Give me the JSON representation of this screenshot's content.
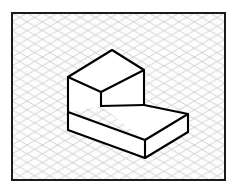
{
  "page": {
    "width": 236,
    "height": 189,
    "background_color": "#ffffff"
  },
  "frame": {
    "name": "drawing-border",
    "x": 11,
    "y": 12,
    "width": 215,
    "height": 169,
    "stroke_color": "#1a1a1a",
    "stroke_width": 2,
    "fill_color": "#fdfdfd"
  },
  "grid": {
    "type": "isometric-diamond",
    "description": "Two families of 30-degree diagonal lines forming diamond cells",
    "cell_width": 15.2,
    "cell_height": 17.6,
    "line_color": "#c9c9c9",
    "line_width": 0.8,
    "has_vertical_lines": false,
    "slope_degrees": 30
  },
  "object": {
    "name": "isometric-step-block",
    "stroke_color": "#000000",
    "stroke_width": 2.1,
    "fill_color": "#ffffff",
    "vertices": {
      "top_face_left": [
        68,
        77
      ],
      "top_face_back": [
        112,
        50
      ],
      "top_face_right": [
        144,
        70
      ],
      "top_face_front": [
        101,
        92
      ],
      "step_inner_bottom": [
        101,
        106
      ],
      "upper_left_bottom": [
        68,
        112
      ],
      "lower_top_right": [
        188,
        114
      ],
      "lower_front_bottom": [
        145,
        158
      ],
      "lower_right_bottom": [
        188,
        132
      ],
      "mid_right_junction": [
        144,
        105
      ]
    },
    "faces": [
      {
        "name": "upper-top-face",
        "points": "68,77 112,50 144,70 101,92",
        "shading": "none"
      },
      {
        "name": "upper-left-face",
        "points": "68,77 101,92 101,106 68,112",
        "shading": "none"
      },
      {
        "name": "lower-top-face",
        "points": "101,106 144,105 188,114 145,140",
        "shading": "none"
      },
      {
        "name": "lower-front-face",
        "points": "68,112 145,140 145,158 68,130",
        "shading": "none"
      },
      {
        "name": "lower-right-face",
        "points": "145,140 188,114 188,132 145,158",
        "shading": "none"
      },
      {
        "name": "step-riser-face",
        "points": "101,92 144,70 144,105 101,106",
        "shading": "none"
      }
    ]
  }
}
